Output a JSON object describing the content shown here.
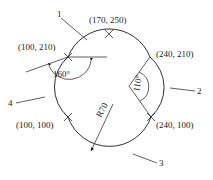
{
  "diagram": {
    "points": [
      {
        "id": "p1",
        "label": "(100, 210)"
      },
      {
        "id": "p2",
        "label": "(170, 250)"
      },
      {
        "id": "p3",
        "label": "(240, 210)"
      },
      {
        "id": "p4",
        "label": "(240, 100)"
      },
      {
        "id": "p5",
        "label": "(100, 100)"
      }
    ],
    "arcs": [
      {
        "id": "1",
        "label": "1"
      },
      {
        "id": "2",
        "label": "2"
      },
      {
        "id": "3",
        "label": "3"
      },
      {
        "id": "4",
        "label": "4"
      }
    ],
    "annotations": {
      "angle_left": "160°",
      "angle_right": "110°",
      "radius": "R70"
    }
  }
}
